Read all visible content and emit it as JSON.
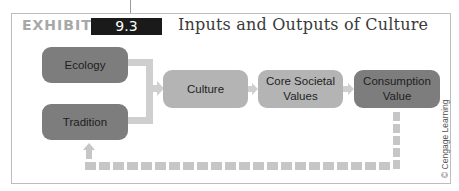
{
  "header": {
    "exhibit_label": "EXHIBIT",
    "exhibit_number": "9.3",
    "title": "Inputs and Outputs of Culture"
  },
  "diagram": {
    "inputs": [
      {
        "id": "ecology",
        "label": "Ecology"
      },
      {
        "id": "tradition",
        "label": "Tradition"
      }
    ],
    "flow": [
      {
        "id": "culture",
        "label": "Culture"
      },
      {
        "id": "core-societal-values",
        "label": "Core Societal Values"
      },
      {
        "id": "consumption-value",
        "label": "Consumption Value"
      }
    ],
    "edges": [
      {
        "from": "ecology",
        "to": "culture",
        "style": "solid"
      },
      {
        "from": "tradition",
        "to": "culture",
        "style": "solid"
      },
      {
        "from": "culture",
        "to": "core-societal-values",
        "style": "solid"
      },
      {
        "from": "core-societal-values",
        "to": "consumption-value",
        "style": "solid"
      },
      {
        "from": "consumption-value",
        "to": "tradition",
        "style": "dashed"
      }
    ],
    "colors": {
      "input_box": "#7d7d7d",
      "culture_box": "#b4b4b4",
      "values_box": "#b4b4b4",
      "consumption_box": "#7d7d7d",
      "connector": "#cfcfcf",
      "exhibit_badge": "#1a1a1a"
    }
  },
  "credit": "© Cengage Learning"
}
